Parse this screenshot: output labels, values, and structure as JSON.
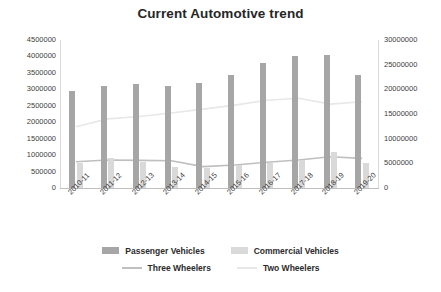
{
  "chart": {
    "title": "Current Automotive trend"
  },
  "axes": {
    "left_ticks": [
      "4500000",
      "4000000",
      "3500000",
      "3000000",
      "2500000",
      "2000000",
      "1500000",
      "1000000",
      "500000",
      "0"
    ],
    "right_ticks": [
      "30000000",
      "25000000",
      "20000000",
      "15000000",
      "10000000",
      "5000000",
      "0"
    ]
  },
  "legend": {
    "items": [
      {
        "label": "Passenger Vehicles",
        "type": "bar",
        "color": "#a6a6a6"
      },
      {
        "label": "Commercial Vehicles",
        "type": "bar",
        "color": "#d9d9d9"
      },
      {
        "label": "Three Wheelers",
        "type": "line",
        "color": "#bfbfbf"
      },
      {
        "label": "Two Wheelers",
        "type": "line",
        "color": "#e8e8e8"
      }
    ]
  },
  "chart_data": {
    "type": "bar",
    "title": "Current Automotive trend",
    "xlabel": "",
    "ylabel": "",
    "grid": false,
    "legend_position": "bottom",
    "categories": [
      "2010-11",
      "2011-12",
      "2012-13",
      "2013-14",
      "2014-15",
      "2015-16",
      "2016-17",
      "2017-18",
      "2018-19",
      "2019-20"
    ],
    "ylim": [
      0,
      4500000
    ],
    "y2lim": [
      0,
      30000000
    ],
    "series": [
      {
        "name": "Passenger Vehicles",
        "type": "bar",
        "axis": "left",
        "color": "#a6a6a6",
        "values": [
          2950000,
          3100000,
          3150000,
          3100000,
          3200000,
          3450000,
          3800000,
          4000000,
          4050000,
          3450000
        ]
      },
      {
        "name": "Commercial Vehicles",
        "type": "bar",
        "axis": "left",
        "color": "#d9d9d9",
        "values": [
          750000,
          900000,
          800000,
          650000,
          600000,
          700000,
          750000,
          850000,
          1100000,
          750000
        ]
      },
      {
        "name": "Three Wheelers",
        "type": "line",
        "axis": "left",
        "color": "#bfbfbf",
        "values": [
          800000,
          850000,
          840000,
          830000,
          650000,
          700000,
          780000,
          850000,
          950000,
          900000
        ]
      },
      {
        "name": "Two Wheelers",
        "type": "line",
        "axis": "right",
        "color": "#e8e8e8",
        "values": [
          12400000,
          14000000,
          14500000,
          15200000,
          16000000,
          16800000,
          17800000,
          18200000,
          17000000,
          17500000
        ]
      }
    ]
  }
}
